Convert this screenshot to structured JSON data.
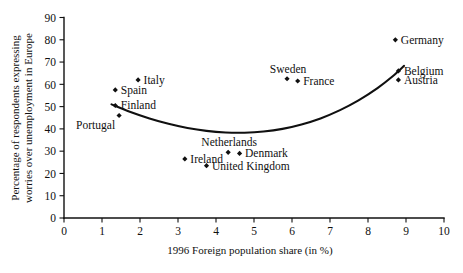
{
  "chart_data": {
    "type": "scatter",
    "title": "",
    "xlabel": "1996 Foreign population share (in %)",
    "ylabel_line1": "Percentage of respondents expressing",
    "ylabel_line2": "worries over unemployment in Europe",
    "xlim": [
      0,
      10
    ],
    "ylim": [
      0,
      90
    ],
    "xticks": [
      "0",
      "1",
      "2",
      "3",
      "4",
      "5",
      "6",
      "7",
      "8",
      "9",
      "10"
    ],
    "xtick_values": [
      0,
      1,
      2,
      3,
      4,
      5,
      6,
      7,
      8,
      9,
      10
    ],
    "yticks": [
      "0",
      "10",
      "20",
      "30",
      "40",
      "50",
      "60",
      "70",
      "80",
      "90"
    ],
    "ytick_values": [
      0,
      10,
      20,
      30,
      40,
      50,
      60,
      70,
      80,
      90
    ],
    "grid": false,
    "legend": "none",
    "marker_color": "#101010",
    "curve_color": "#101010",
    "points": [
      {
        "label": "Italy",
        "x": 1.95,
        "y": 62.0,
        "label_pos": "right"
      },
      {
        "label": "Spain",
        "x": 1.35,
        "y": 57.5,
        "label_pos": "right"
      },
      {
        "label": "Finland",
        "x": 1.35,
        "y": 50.5,
        "label_pos": "right"
      },
      {
        "label": "Portugal",
        "x": 1.45,
        "y": 46.0,
        "label_pos": "below-left"
      },
      {
        "label": "Ireland",
        "x": 3.18,
        "y": 26.5,
        "label_pos": "right"
      },
      {
        "label": "United Kingdom",
        "x": 3.75,
        "y": 23.5,
        "label_pos": "right"
      },
      {
        "label": "Netherlands",
        "x": 4.32,
        "y": 29.5,
        "label_pos": "above-right"
      },
      {
        "label": "Denmark",
        "x": 4.62,
        "y": 29.0,
        "label_pos": "right"
      },
      {
        "label": "Sweden",
        "x": 5.87,
        "y": 62.5,
        "label_pos": "above"
      },
      {
        "label": "France",
        "x": 6.15,
        "y": 61.5,
        "label_pos": "right"
      },
      {
        "label": "Germany",
        "x": 8.72,
        "y": 80.0,
        "label_pos": "right"
      },
      {
        "label": "Belgium",
        "x": 8.8,
        "y": 66.0,
        "label_pos": "right"
      },
      {
        "label": "Austria",
        "x": 8.8,
        "y": 62.0,
        "label_pos": "right"
      }
    ],
    "fit_curve": {
      "description": "quadratic fit, u-shaped, minimum near x=4.4",
      "points": [
        {
          "x": 1.25,
          "y": 51.0
        },
        {
          "x": 1.75,
          "y": 47.6
        },
        {
          "x": 2.25,
          "y": 44.7
        },
        {
          "x": 2.75,
          "y": 42.3
        },
        {
          "x": 3.25,
          "y": 40.4
        },
        {
          "x": 3.75,
          "y": 39.1
        },
        {
          "x": 4.25,
          "y": 38.4
        },
        {
          "x": 4.75,
          "y": 38.3
        },
        {
          "x": 5.25,
          "y": 38.8
        },
        {
          "x": 5.75,
          "y": 40.0
        },
        {
          "x": 6.25,
          "y": 42.0
        },
        {
          "x": 6.75,
          "y": 44.7
        },
        {
          "x": 7.25,
          "y": 48.3
        },
        {
          "x": 7.75,
          "y": 52.8
        },
        {
          "x": 8.25,
          "y": 58.3
        },
        {
          "x": 8.65,
          "y": 63.6
        },
        {
          "x": 8.95,
          "y": 68.3
        }
      ]
    }
  }
}
